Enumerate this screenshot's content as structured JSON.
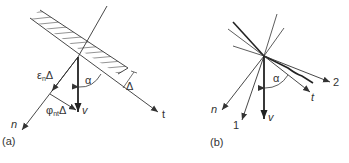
{
  "figure": {
    "panels": [
      {
        "id": "a",
        "caption": "(a)",
        "labels": {
          "n": "n",
          "t": "t",
          "v": "v",
          "alpha": "α",
          "delta": "Δ",
          "epsilon_main": "ε",
          "epsilon_sub": "n",
          "epsilon_tail": "Δ",
          "phi_main": "φ",
          "phi_sub": "nt",
          "phi_tail": "Δ"
        }
      },
      {
        "id": "b",
        "caption": "(b)",
        "labels": {
          "n": "n",
          "one": "1",
          "v": "v",
          "t": "t",
          "two": "2",
          "alpha": "α"
        }
      }
    ],
    "colors": {
      "line": "#333333",
      "hatch": "#555555",
      "background": "#ffffff"
    }
  }
}
